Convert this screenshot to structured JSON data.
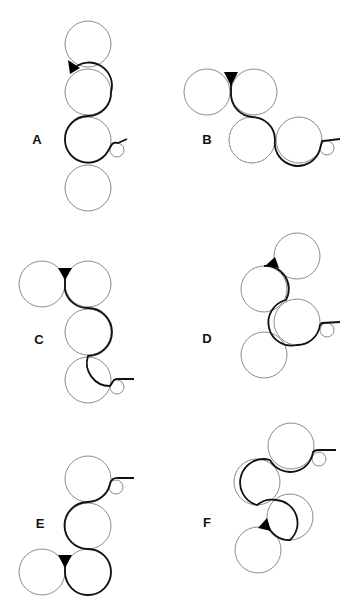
{
  "figure": {
    "colors": {
      "roller_outline": "#8a8a8a",
      "web_path": "#111111",
      "nip_wedge": "#000000"
    },
    "panels": [
      {
        "label": "A",
        "label_pos": [
          37,
          139
        ],
        "rollers": [
          [
            88,
            44,
            23
          ],
          [
            88,
            92,
            23
          ],
          [
            88,
            140,
            23
          ],
          [
            88,
            188,
            23
          ]
        ],
        "small_roller": [
          117,
          150,
          7
        ],
        "web_path": "M 74 68 A 23 23 0 0 1 111 92 A 23 23 0 0 1 88 116 A 23 23 0 0 0 65 140 A 23 23 0 0 0 108 151 L 112 144 A 7 7 0 0 1 118 143 L 127 139",
        "nip_wedge": [
          [
            68,
            60
          ],
          [
            80,
            68
          ],
          [
            70,
            74
          ]
        ]
      },
      {
        "label": "B",
        "label_pos": [
          207,
          139
        ],
        "rollers": [
          [
            207,
            92,
            23
          ],
          [
            254,
            92,
            23
          ],
          [
            252,
            140,
            23
          ],
          [
            299,
            140,
            23
          ]
        ],
        "small_roller": [
          327,
          148,
          7
        ],
        "web_path": "M 231 78 L 231 95 A 23 23 0 0 0 252 117 A 23 23 0 0 1 275 140 A 23 23 0 0 0 320 149 L 322 141 L 340 139",
        "nip_wedge": [
          [
            224,
            72
          ],
          [
            238,
            72
          ],
          [
            231,
            86
          ]
        ]
      },
      {
        "label": "C",
        "label_pos": [
          39,
          339
        ],
        "rollers": [
          [
            42,
            284,
            23
          ],
          [
            88,
            284,
            23
          ],
          [
            88,
            332,
            23
          ],
          [
            88,
            380,
            23
          ]
        ],
        "small_roller": [
          117,
          387,
          7
        ],
        "web_path": "M 65 276 L 65 290 A 23 23 0 0 0 88 308 A 23 23 0 0 1 88 356 A 23 23 0 0 0 110 386 L 114 380 A 7 7 0 0 1 119 379 L 134 379",
        "nip_wedge": [
          [
            58,
            268
          ],
          [
            72,
            268
          ],
          [
            65,
            280
          ]
        ]
      },
      {
        "label": "D",
        "label_pos": [
          207,
          338
        ],
        "rollers": [
          [
            297,
            256,
            23
          ],
          [
            264,
            289,
            23
          ],
          [
            297,
            322,
            23
          ],
          [
            264,
            355,
            23
          ]
        ],
        "small_roller": [
          327,
          330,
          7
        ],
        "web_path": "M 264 266 A 23 23 0 0 1 286 300 A 23 23 0 0 0 297 345 A 23 23 0 0 0 320 325 L 322 323 L 340 322",
        "nip_wedge": [
          [
            265,
            266
          ],
          [
            275,
            257
          ],
          [
            279,
            268
          ]
        ]
      },
      {
        "label": "E",
        "label_pos": [
          40,
          523
        ],
        "rollers": [
          [
            88,
            479,
            23
          ],
          [
            88,
            526,
            23
          ],
          [
            42,
            572,
            23
          ],
          [
            88,
            572,
            23
          ]
        ],
        "small_roller": [
          116,
          487,
          7
        ],
        "web_path": "M 134 478 L 118 478 A 7 7 0 0 0 110 484 A 23 23 0 0 1 88 502 A 23 23 0 0 0 88 549 A 23 23 0 0 1 88 595 A 23 23 0 0 1 65 572 L 65 558",
        "nip_wedge": [
          [
            58,
            555
          ],
          [
            72,
            555
          ],
          [
            65,
            568
          ]
        ]
      },
      {
        "label": "F",
        "label_pos": [
          207,
          522
        ],
        "rollers": [
          [
            291,
            446,
            23
          ],
          [
            257,
            482,
            23
          ],
          [
            290,
            517,
            23
          ],
          [
            258,
            550,
            23
          ]
        ],
        "small_roller": [
          319,
          459,
          7
        ],
        "web_path": "M 336 450 L 318 450 A 7 7 0 0 0 313 452 A 23 23 0 0 1 270 460 A 23 23 0 0 0 257 505 A 23 23 0 0 1 276 500 A 23 23 0 0 1 290 540 A 23 23 0 0 1 267 524",
        "nip_wedge": [
          [
            258,
            528
          ],
          [
            267,
            518
          ],
          [
            271,
            531
          ]
        ]
      }
    ]
  }
}
